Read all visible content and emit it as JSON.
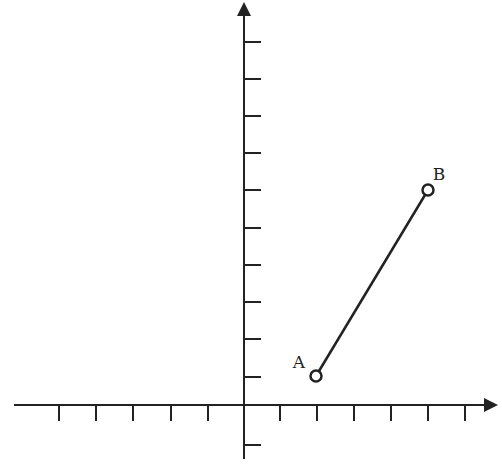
{
  "diagram": {
    "type": "coordinate-plane",
    "stroke_color": "#222222",
    "background": "#ffffff",
    "origin_px": [
      244,
      405
    ],
    "x_axis": {
      "start_px": 14,
      "end_px": 498,
      "arrow": "right",
      "tick_px": [
        59,
        96,
        133,
        171,
        208,
        280,
        317,
        354,
        391,
        428,
        465
      ],
      "negative_ticks": 5,
      "positive_ticks": 6
    },
    "y_axis": {
      "start_px": 459,
      "end_px": 2,
      "arrow": "up",
      "tick_px": [
        445,
        377,
        339,
        302,
        265,
        228,
        190,
        153,
        116,
        79,
        42
      ],
      "negative_ticks": 1,
      "positive_ticks": 10
    },
    "points": [
      {
        "label": "A",
        "grid": [
          2,
          1
        ],
        "px": [
          316,
          376
        ],
        "label_px": [
          299,
          368
        ],
        "style": "open-circle"
      },
      {
        "label": "B",
        "grid": [
          5,
          6
        ],
        "px": [
          428,
          190
        ],
        "label_px": [
          439,
          180
        ],
        "style": "open-circle"
      }
    ],
    "segments": [
      {
        "from": "A",
        "to": "B"
      }
    ]
  }
}
